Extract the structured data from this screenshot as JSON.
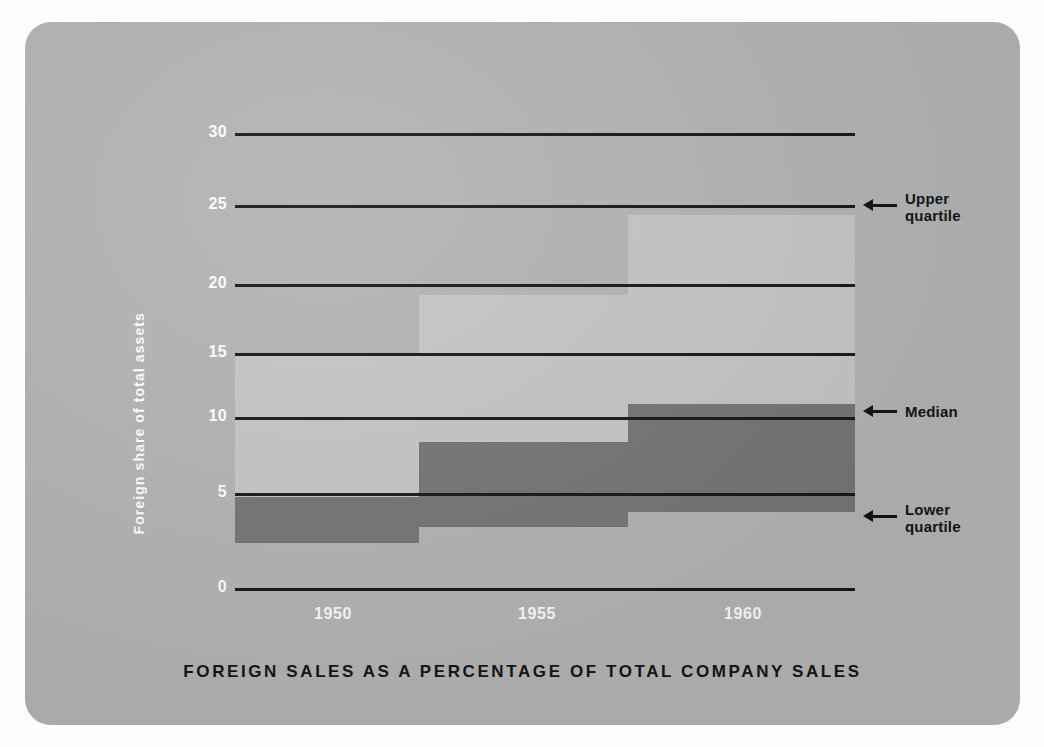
{
  "chart_data": {
    "type": "area",
    "title": "FOREIGN SALES AS A PERCENTAGE OF TOTAL COMPANY SALES",
    "xlabel": "",
    "ylabel": "Foreign share of total assets",
    "grid": true,
    "legend_position": "right-annotations",
    "ylim": [
      0,
      30
    ],
    "yticks": [
      "0",
      "5",
      "10",
      "15",
      "20",
      "25",
      "30"
    ],
    "ytick_values": [
      0,
      5,
      10,
      15,
      20,
      25,
      30
    ],
    "xticks": [
      "1950",
      "1955",
      "1960"
    ],
    "xtick_values": [
      1950,
      1955,
      1960
    ],
    "xlim": [
      1948,
      1962.5
    ],
    "x_periods": [
      {
        "label": "1948-1952",
        "start": 1948,
        "end": 1952.3
      },
      {
        "label": "1953-1957",
        "start": 1952.3,
        "end": 1957.2
      },
      {
        "label": "1958-1962",
        "start": 1957.2,
        "end": 1962.5
      }
    ],
    "series": [
      {
        "name": "Upper quartile",
        "values": [
          15.4,
          19.3,
          24.6
        ]
      },
      {
        "name": "Median",
        "values": [
          6.0,
          9.6,
          12.1
        ]
      },
      {
        "name": "Lower quartile",
        "values": [
          3.0,
          4.0,
          5.0
        ]
      }
    ],
    "annotations": [
      {
        "name": "upper-quartile",
        "label": "Upper\nquartile",
        "value": 25
      },
      {
        "name": "median",
        "label": "Median",
        "value": 12
      },
      {
        "name": "lower-quartile",
        "label": "Lower\nquartile",
        "value": 5
      }
    ],
    "colors": {
      "background": "#b3b3b3",
      "upper_band": "#c5c5c5",
      "mid_band": "#a8a8a8",
      "lower_band": "#757575",
      "gridline": "#16181a",
      "tick_text": "#ffffff",
      "title_text": "#121416"
    }
  },
  "axis": {
    "y_label": "Foreign share of total assets",
    "y_ticks": [
      "30",
      "25",
      "20",
      "15",
      "10",
      "5",
      "0"
    ],
    "x_ticks": [
      "1950",
      "1955",
      "1960"
    ]
  },
  "title": {
    "text": "FOREIGN SALES AS A PERCENTAGE OF TOTAL COMPANY SALES"
  },
  "annotations": {
    "upper": "Upper\nquartile",
    "median": "Median",
    "lower": "Lower\nquartile"
  }
}
